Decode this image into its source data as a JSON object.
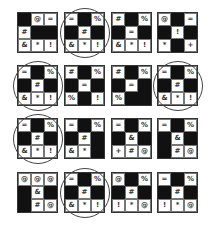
{
  "puzzle": {
    "rows": [
      [
        {
          "circled": false,
          "cells": [
            "■",
            "@",
            "=",
            "#",
            "■",
            "■",
            "&",
            "*",
            "!"
          ]
        },
        {
          "circled": true,
          "cells": [
            "=",
            "■",
            "%",
            "■",
            "#",
            "■",
            "&",
            "*",
            "!"
          ]
        },
        {
          "circled": false,
          "cells": [
            "#",
            "■",
            "%",
            "■",
            "=",
            "■",
            "&",
            "*",
            "!"
          ]
        },
        {
          "circled": false,
          "cells": [
            "@",
            "■",
            "=",
            "■",
            "!",
            "■",
            "*",
            "■",
            "+"
          ]
        }
      ],
      [
        {
          "circled": true,
          "cells": [
            "=",
            "■",
            "%",
            "■",
            "#",
            "■",
            "&",
            "*",
            "!"
          ]
        },
        {
          "circled": false,
          "cells": [
            "#",
            "■",
            "%",
            "■",
            "=",
            "■",
            "%",
            "■",
            "!"
          ]
        },
        {
          "circled": false,
          "cells": [
            "#",
            "■",
            "%",
            "■",
            "=",
            "■",
            "%",
            "■",
            "■"
          ]
        },
        {
          "circled": true,
          "cells": [
            "=",
            "■",
            "%",
            "■",
            "#",
            "■",
            "&",
            "*",
            "!"
          ]
        }
      ],
      [
        {
          "circled": true,
          "cells": [
            "=",
            "■",
            "%",
            "■",
            "#",
            "■",
            "&",
            "*",
            "!"
          ]
        },
        {
          "circled": false,
          "cells": [
            "=",
            "■",
            "%",
            "■",
            "#",
            "■",
            "&",
            "*",
            "■"
          ]
        },
        {
          "circled": false,
          "cells": [
            "=",
            "■",
            "%",
            "■",
            "&",
            "■",
            "+",
            "#",
            "@"
          ]
        },
        {
          "circled": false,
          "cells": [
            "=",
            "■",
            "%",
            "■",
            "&",
            "■",
            "■",
            "#",
            "@"
          ]
        }
      ],
      [
        {
          "circled": false,
          "cells": [
            "@",
            "@",
            "@",
            "■",
            "&",
            "■",
            "■",
            "#",
            "@"
          ]
        },
        {
          "circled": true,
          "cells": [
            "=",
            "■",
            "%",
            "■",
            "#",
            "■",
            "&",
            "*",
            "!"
          ]
        },
        {
          "circled": false,
          "cells": [
            "@",
            "■",
            "%",
            "■",
            "#",
            "■",
            "!",
            "*",
            "@"
          ]
        },
        {
          "circled": false,
          "cells": [
            "=",
            "■",
            "%",
            "■",
            "#",
            "■",
            "!",
            "*",
            "@"
          ]
        }
      ]
    ],
    "black_marker": "■",
    "colors": {
      "black_cell": "#111111",
      "border": "#333333",
      "background": "#ffffff"
    }
  }
}
